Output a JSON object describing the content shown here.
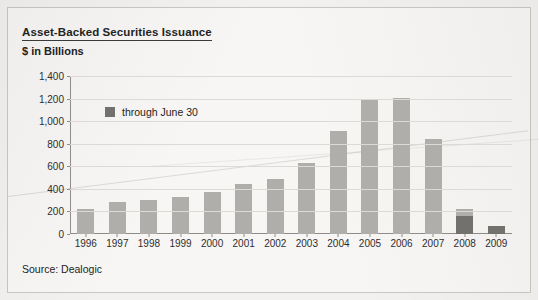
{
  "figure": {
    "title": "Asset-Backed Securities Issuance",
    "subtitle": "$ in Billions",
    "source": "Source: Dealogic"
  },
  "legend": {
    "items": [
      {
        "label": "through June 30",
        "color": "#73716e"
      }
    ]
  },
  "colors": {
    "full_year_bar": "#b0aeaa",
    "through_june_bar": "#73716e",
    "gridline": "#dcdad6",
    "axis": "#8e8c88",
    "text": "#232323",
    "page_background": "#f7f6f4"
  },
  "chart_data": {
    "type": "bar",
    "title": "Asset-Backed Securities Issuance",
    "subtitle": "$ in Billions",
    "xlabel": "",
    "ylabel": "$ in Billions",
    "ylim": [
      0,
      1400
    ],
    "yticks": [
      "0",
      "200",
      "400",
      "600",
      "800",
      "1,000",
      "1,200",
      "1,400"
    ],
    "ytick_values": [
      0,
      200,
      400,
      600,
      800,
      1000,
      1200,
      1400
    ],
    "grid": true,
    "legend_position": "upper-left-inside",
    "categories": [
      "1996",
      "1997",
      "1998",
      "1999",
      "2000",
      "2001",
      "2002",
      "2003",
      "2004",
      "2005",
      "2006",
      "2007",
      "2008",
      "2009"
    ],
    "series": [
      {
        "name": "Full year issuance",
        "color": "#b0aeaa",
        "values": [
          225,
          280,
          300,
          325,
          375,
          440,
          490,
          625,
          915,
          1190,
          1205,
          845,
          225,
          null
        ]
      },
      {
        "name": "through June 30",
        "color": "#73716e",
        "values": [
          null,
          null,
          null,
          null,
          null,
          null,
          null,
          null,
          null,
          null,
          null,
          null,
          160,
          75
        ]
      }
    ],
    "bars": [
      {
        "category": "1996",
        "total": 225,
        "partial": 0
      },
      {
        "category": "1997",
        "total": 280,
        "partial": 0
      },
      {
        "category": "1998",
        "total": 300,
        "partial": 0
      },
      {
        "category": "1999",
        "total": 325,
        "partial": 0
      },
      {
        "category": "2000",
        "total": 375,
        "partial": 0
      },
      {
        "category": "2001",
        "total": 440,
        "partial": 0
      },
      {
        "category": "2002",
        "total": 490,
        "partial": 0
      },
      {
        "category": "2003",
        "total": 625,
        "partial": 0
      },
      {
        "category": "2004",
        "total": 915,
        "partial": 0
      },
      {
        "category": "2005",
        "total": 1190,
        "partial": 0
      },
      {
        "category": "2006",
        "total": 1205,
        "partial": 0
      },
      {
        "category": "2007",
        "total": 845,
        "partial": 0
      },
      {
        "category": "2008",
        "total": 225,
        "partial": 160
      },
      {
        "category": "2009",
        "total": 75,
        "partial": 75
      }
    ]
  }
}
